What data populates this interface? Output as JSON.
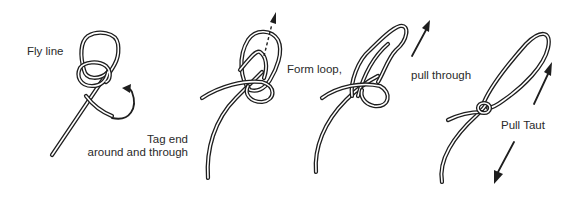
{
  "diagram": {
    "type": "knot-tying-steps",
    "background": "#ffffff",
    "line_color": "#1e1e1e",
    "steps": [
      {
        "id": 1,
        "labels": [
          "Fly line",
          "Tag end",
          "around and through"
        ],
        "arrows": [
          "curved-arrow"
        ]
      },
      {
        "id": 2,
        "labels": [],
        "arrows": [
          "dashed-arrow-up"
        ]
      },
      {
        "id": 3,
        "labels": [
          "Form loop,",
          "pull through"
        ],
        "arrows": [
          "arrow-up-right"
        ]
      },
      {
        "id": 4,
        "labels": [
          "Pull Taut"
        ],
        "arrows": [
          "arrow-up-right",
          "arrow-down-left"
        ]
      }
    ]
  },
  "labels": {
    "fly_line": "Fly line",
    "tag_end_line1": "Tag end",
    "tag_end_line2": "around and through",
    "form_loop": "Form loop,",
    "pull_through": "pull through",
    "pull_taut": "Pull Taut"
  }
}
